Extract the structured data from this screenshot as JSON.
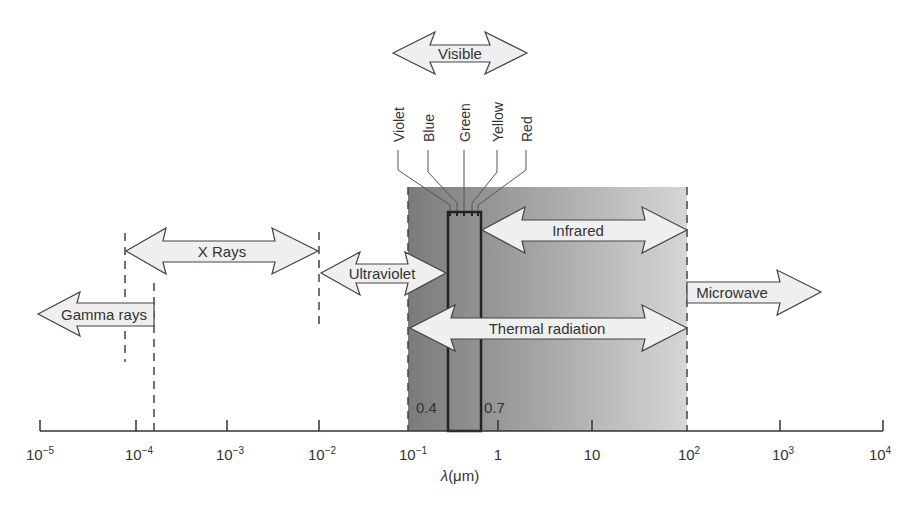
{
  "figure": {
    "axis_label": "λ(μm)",
    "axis_label_parts": {
      "lambda": "λ",
      "unit": "(μm)"
    },
    "ticks": [
      {
        "base": "10",
        "exp": "−5",
        "x": 40
      },
      {
        "base": "10",
        "exp": "−4",
        "x": 136
      },
      {
        "base": "10",
        "exp": "−3",
        "x": 227
      },
      {
        "base": "10",
        "exp": "−2",
        "x": 319
      },
      {
        "base": "10",
        "exp": "−1",
        "x": 410
      },
      {
        "base": "1",
        "exp": "",
        "x": 498
      },
      {
        "base": "10",
        "exp": "",
        "x": 592
      },
      {
        "base": "10",
        "exp": "2",
        "x": 686
      },
      {
        "base": "10",
        "exp": "3",
        "x": 780
      },
      {
        "base": "10",
        "exp": "4",
        "x": 883
      }
    ],
    "bands": {
      "visible": "Visible",
      "xrays": "X Rays",
      "gamma": "Gamma rays",
      "ultraviolet": "Ultraviolet",
      "infrared": "Infrared",
      "microwave": "Microwave",
      "thermal": "Thermal radiation"
    },
    "colors_list": [
      "Violet",
      "Blue",
      "Green",
      "Yellow",
      "Red"
    ],
    "visible_bounds": {
      "left": "0.4",
      "right": "0.7"
    },
    "colors": {
      "shade_dark": "#7d7d7d",
      "shade_light": "#d4d4d4",
      "arrow_fill": "#efefef",
      "line": "#333333"
    }
  }
}
